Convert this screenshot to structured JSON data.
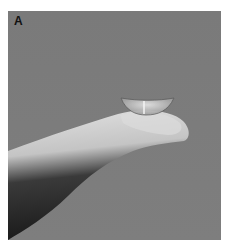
{
  "figure": {
    "panel_label": "A",
    "colors": {
      "background": "#7b7b7b",
      "finger_light": "#d8d8d8",
      "finger_shadow": "#1e1e1e",
      "lens": "#c9c9c9"
    }
  }
}
